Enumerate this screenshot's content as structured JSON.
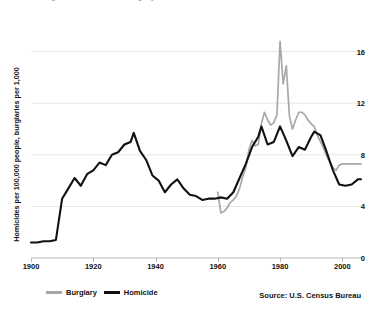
{
  "chart_data": {
    "type": "line",
    "title": "Figure 1. Homicide and burglary rates",
    "xlabel": "",
    "ylabel": "Homicides per 100,000 people, burglaries per 1,000",
    "source": "Source: U.S. Census Bureau",
    "grid": true,
    "legend_position": "bottom-left",
    "xlim": [
      1900,
      2006
    ],
    "ylim": [
      0,
      17.6
    ],
    "xticks": [
      1900,
      1920,
      1940,
      1960,
      1980,
      2000
    ],
    "xtick_labels": [
      "1900",
      "1920",
      "1940",
      "1960",
      "1980",
      "2000"
    ],
    "yticks": [
      0,
      4,
      8,
      12,
      16
    ],
    "ytick_labels": [
      "0",
      "4",
      "8",
      "12",
      "16"
    ],
    "series": [
      {
        "name": "Burglary",
        "color": "#a8a8a8",
        "x": [
          1960,
          1961,
          1962,
          1963,
          1964,
          1965,
          1966,
          1967,
          1968,
          1969,
          1970,
          1971,
          1972,
          1973,
          1974,
          1975,
          1976,
          1977,
          1978,
          1979,
          1980,
          1981,
          1982,
          1983,
          1984,
          1985,
          1986,
          1987,
          1988,
          1989,
          1990,
          1991,
          1992,
          1993,
          1994,
          1995,
          1996,
          1997,
          1998,
          1999,
          2000,
          2001,
          2002,
          2003,
          2004,
          2005,
          2006
        ],
        "values": [
          5.1,
          3.5,
          3.6,
          3.9,
          4.3,
          4.5,
          4.8,
          5.4,
          6.3,
          7.0,
          8.4,
          9.1,
          8.7,
          8.8,
          10.4,
          11.3,
          10.7,
          10.3,
          10.5,
          11.1,
          16.8,
          13.5,
          14.9,
          11.0,
          10.0,
          10.7,
          11.3,
          11.3,
          11.1,
          10.7,
          10.4,
          10.2,
          9.5,
          9.0,
          8.5,
          7.9,
          7.4,
          7.0,
          6.8,
          7.2,
          7.3,
          7.3,
          7.3,
          7.3,
          7.3,
          7.3,
          7.3
        ]
      },
      {
        "name": "Homicide",
        "color": "#111111",
        "x": [
          1900,
          1902,
          1904,
          1906,
          1908,
          1910,
          1912,
          1914,
          1916,
          1918,
          1920,
          1922,
          1924,
          1926,
          1928,
          1930,
          1932,
          1933,
          1935,
          1937,
          1939,
          1941,
          1943,
          1945,
          1947,
          1949,
          1951,
          1953,
          1955,
          1957,
          1959,
          1961,
          1963,
          1965,
          1967,
          1969,
          1971,
          1973,
          1974,
          1976,
          1978,
          1980,
          1982,
          1984,
          1986,
          1988,
          1990,
          1991,
          1993,
          1995,
          1997,
          1999,
          2001,
          2003,
          2005,
          2006
        ],
        "values": [
          1.2,
          1.2,
          1.3,
          1.3,
          1.4,
          4.6,
          5.4,
          6.2,
          5.6,
          6.5,
          6.8,
          7.4,
          7.2,
          8.0,
          8.2,
          8.8,
          9.0,
          9.7,
          8.3,
          7.6,
          6.4,
          6.0,
          5.1,
          5.7,
          6.1,
          5.4,
          4.9,
          4.8,
          4.5,
          4.6,
          4.6,
          4.7,
          4.6,
          5.1,
          6.2,
          7.3,
          8.6,
          9.4,
          10.2,
          8.8,
          9.0,
          10.2,
          9.1,
          7.9,
          8.6,
          8.4,
          9.4,
          9.8,
          9.5,
          8.2,
          6.8,
          5.7,
          5.6,
          5.7,
          6.1,
          6.1
        ]
      }
    ]
  },
  "legend": {
    "items": [
      {
        "label": "Burglary",
        "color": "#a8a8a8"
      },
      {
        "label": "Homicide",
        "color": "#111111"
      }
    ]
  }
}
